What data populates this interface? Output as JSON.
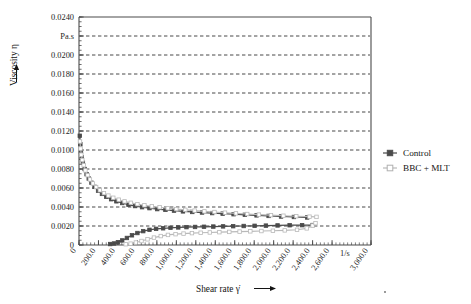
{
  "chart_data": {
    "type": "line",
    "title": "",
    "subtitle": "",
    "xlabel": "Shear rate γ̇",
    "ylabel": "Viscosity η",
    "xunit": "1/s",
    "yunit": "Pa.s",
    "xlim": [
      0,
      3000
    ],
    "ylim": [
      0,
      0.024
    ],
    "grid": "horizontal-dashed",
    "legend_position": "right-middle",
    "x_ticks": [
      0,
      200,
      400,
      600,
      800,
      1000,
      1200,
      1400,
      1600,
      1800,
      2000,
      2200,
      2400,
      2600,
      3000
    ],
    "x_tick_labels": [
      "0",
      "200.0",
      "400.0",
      "600.0",
      "800.0",
      "1,000.0",
      "1,200.0",
      "1,400.0",
      "1,600.0",
      "1,800.0",
      "2,000.0",
      "2,200.0",
      "2,400.0",
      "2,600.0",
      "3,000.0"
    ],
    "x_minor_tick_interval": 40,
    "y_ticks": [
      0,
      0.002,
      0.004,
      0.006,
      0.008,
      0.01,
      0.012,
      0.014,
      0.016,
      0.018,
      0.02,
      0.022,
      0.024
    ],
    "y_tick_labels": [
      "0",
      "0.0020",
      "0.0040",
      "0.0060",
      "0.0080",
      "0.0100",
      "0.0120",
      "0.0140",
      "0.0160",
      "0.0180",
      "0.0200",
      "Pa.s",
      "0.0240"
    ],
    "y_minor_tick_interval": 0.0005,
    "series": [
      {
        "name": "Control",
        "color": "#4a4a4a",
        "marker": "square-filled",
        "branch": "upper-descending",
        "points": [
          [
            8,
            0.0115
          ],
          [
            14,
            0.0106
          ],
          [
            20,
            0.00985
          ],
          [
            28,
            0.00925
          ],
          [
            40,
            0.00865
          ],
          [
            58,
            0.008
          ],
          [
            78,
            0.00745
          ],
          [
            100,
            0.007
          ],
          [
            128,
            0.00655
          ],
          [
            160,
            0.00612
          ],
          [
            196,
            0.00572
          ],
          [
            236,
            0.00538
          ],
          [
            280,
            0.00508
          ],
          [
            330,
            0.00482
          ],
          [
            384,
            0.0046
          ],
          [
            444,
            0.00442
          ],
          [
            508,
            0.00424
          ],
          [
            576,
            0.0041
          ],
          [
            648,
            0.00398
          ],
          [
            724,
            0.00388
          ],
          [
            804,
            0.00378
          ],
          [
            888,
            0.0037
          ],
          [
            976,
            0.00362
          ],
          [
            1068,
            0.00354
          ],
          [
            1164,
            0.00348
          ],
          [
            1264,
            0.00342
          ],
          [
            1368,
            0.00336
          ],
          [
            1476,
            0.0033
          ],
          [
            1588,
            0.00324
          ],
          [
            1704,
            0.00318
          ],
          [
            1824,
            0.00312
          ],
          [
            1948,
            0.00306
          ],
          [
            2076,
            0.003
          ],
          [
            2208,
            0.00295
          ],
          [
            2344,
            0.0029
          ]
        ]
      },
      {
        "name": "Control",
        "color": "#4a4a4a",
        "marker": "square-filled",
        "branch": "lower-ascending",
        "points": [
          [
            320,
            0.0001
          ],
          [
            360,
            0.00016
          ],
          [
            400,
            0.00028
          ],
          [
            444,
            0.00048
          ],
          [
            492,
            0.00074
          ],
          [
            544,
            0.00102
          ],
          [
            600,
            0.00126
          ],
          [
            660,
            0.00146
          ],
          [
            724,
            0.0016
          ],
          [
            792,
            0.0017
          ],
          [
            864,
            0.00176
          ],
          [
            940,
            0.00181
          ],
          [
            1020,
            0.00185
          ],
          [
            1104,
            0.00188
          ],
          [
            1192,
            0.0019
          ],
          [
            1284,
            0.00192
          ],
          [
            1380,
            0.00194
          ],
          [
            1480,
            0.00196
          ],
          [
            1584,
            0.00198
          ],
          [
            1692,
            0.002
          ],
          [
            1804,
            0.00202
          ],
          [
            1920,
            0.00204
          ],
          [
            2040,
            0.00206
          ],
          [
            2164,
            0.00208
          ],
          [
            2292,
            0.00209
          ],
          [
            2400,
            0.0021
          ]
        ]
      },
      {
        "name": "BBC + MLT",
        "color": "#b9b9b9",
        "marker": "square-open",
        "branch": "upper-descending",
        "points": [
          [
            10,
            0.0109
          ],
          [
            16,
            0.01015
          ],
          [
            24,
            0.0095
          ],
          [
            34,
            0.00895
          ],
          [
            48,
            0.0084
          ],
          [
            66,
            0.00785
          ],
          [
            88,
            0.00735
          ],
          [
            112,
            0.0069
          ],
          [
            142,
            0.00648
          ],
          [
            176,
            0.0061
          ],
          [
            214,
            0.00576
          ],
          [
            256,
            0.00546
          ],
          [
            302,
            0.0052
          ],
          [
            352,
            0.00497
          ],
          [
            408,
            0.00477
          ],
          [
            468,
            0.00459
          ],
          [
            532,
            0.00444
          ],
          [
            600,
            0.0043
          ],
          [
            672,
            0.00418
          ],
          [
            748,
            0.00407
          ],
          [
            828,
            0.00397
          ],
          [
            912,
            0.00387
          ],
          [
            1000,
            0.00378
          ],
          [
            1092,
            0.0037
          ],
          [
            1188,
            0.00362
          ],
          [
            1288,
            0.00354
          ],
          [
            1392,
            0.00347
          ],
          [
            1500,
            0.0034
          ],
          [
            1612,
            0.00333
          ],
          [
            1728,
            0.00326
          ],
          [
            1848,
            0.0032
          ],
          [
            1972,
            0.00314
          ],
          [
            2100,
            0.00308
          ],
          [
            2232,
            0.00303
          ],
          [
            2368,
            0.00298
          ],
          [
            2440,
            0.00296
          ]
        ]
      },
      {
        "name": "BBC + MLT",
        "color": "#b9b9b9",
        "marker": "square-open",
        "branch": "lower-ascending",
        "points": [
          [
            480,
            8e-05
          ],
          [
            530,
            0.00014
          ],
          [
            584,
            0.00026
          ],
          [
            642,
            0.00042
          ],
          [
            704,
            0.0006
          ],
          [
            770,
            0.00078
          ],
          [
            840,
            0.00094
          ],
          [
            914,
            0.00106
          ],
          [
            992,
            0.00114
          ],
          [
            1074,
            0.0012
          ],
          [
            1160,
            0.00125
          ],
          [
            1250,
            0.00129
          ],
          [
            1344,
            0.00132
          ],
          [
            1442,
            0.00135
          ],
          [
            1544,
            0.00138
          ],
          [
            1650,
            0.00141
          ],
          [
            1760,
            0.00144
          ],
          [
            1874,
            0.00147
          ],
          [
            1992,
            0.0015
          ],
          [
            2114,
            0.00154
          ],
          [
            2240,
            0.0016
          ],
          [
            2340,
            0.00175
          ],
          [
            2400,
            0.00205
          ],
          [
            2430,
            0.0023
          ]
        ]
      }
    ]
  },
  "legend": {
    "entries": [
      {
        "label": "Control",
        "color": "#4a4a4a",
        "marker": "square-filled"
      },
      {
        "label": "BBC + MLT",
        "color": "#b9b9b9",
        "marker": "square-open"
      }
    ]
  },
  "axes": {
    "y_title": "Viscosity η",
    "x_title": "Shear rate γ̇",
    "y_unit": "Pa.s",
    "x_unit": "1/s",
    "y_arrow": "up-arrow-icon",
    "x_arrow": "right-arrow-icon"
  },
  "colors": {
    "control": "#4a4a4a",
    "bbc_mlt": "#b9b9b9",
    "axis": "#4a4a4a",
    "grid": "#333333",
    "background": "#ffffff"
  }
}
